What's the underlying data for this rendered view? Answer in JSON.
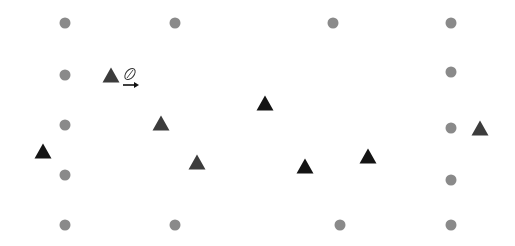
{
  "diagram": {
    "width": 515,
    "height": 246,
    "colors": {
      "background": "#ffffff",
      "circle": "#8a8a8a",
      "triangle_dark": "#3c3c3c",
      "triangle_black": "#141414",
      "ball_stroke": "#333333",
      "arrow": "#111111"
    },
    "circles": [
      {
        "x": 65,
        "y": 23
      },
      {
        "x": 175,
        "y": 23
      },
      {
        "x": 333,
        "y": 23
      },
      {
        "x": 451,
        "y": 23
      },
      {
        "x": 65,
        "y": 75
      },
      {
        "x": 451,
        "y": 72
      },
      {
        "x": 65,
        "y": 125
      },
      {
        "x": 451,
        "y": 128
      },
      {
        "x": 65,
        "y": 175
      },
      {
        "x": 451,
        "y": 180
      },
      {
        "x": 65,
        "y": 225
      },
      {
        "x": 175,
        "y": 225
      },
      {
        "x": 340,
        "y": 225
      },
      {
        "x": 451,
        "y": 225
      }
    ],
    "triangles": [
      {
        "x": 111,
        "y": 76,
        "shade": "dark"
      },
      {
        "x": 161,
        "y": 124,
        "shade": "dark"
      },
      {
        "x": 43,
        "y": 152,
        "shade": "black"
      },
      {
        "x": 197,
        "y": 163,
        "shade": "dark"
      },
      {
        "x": 265,
        "y": 104,
        "shade": "black"
      },
      {
        "x": 305,
        "y": 167,
        "shade": "black"
      },
      {
        "x": 368,
        "y": 157,
        "shade": "black"
      },
      {
        "x": 480,
        "y": 129,
        "shade": "dark"
      }
    ],
    "ball": {
      "x": 130,
      "y": 74,
      "icon": "football-icon"
    },
    "arrow": {
      "x1": 123,
      "y1": 85,
      "x2": 139,
      "y2": 85,
      "direction": "right",
      "icon": "arrow-right-icon"
    }
  }
}
